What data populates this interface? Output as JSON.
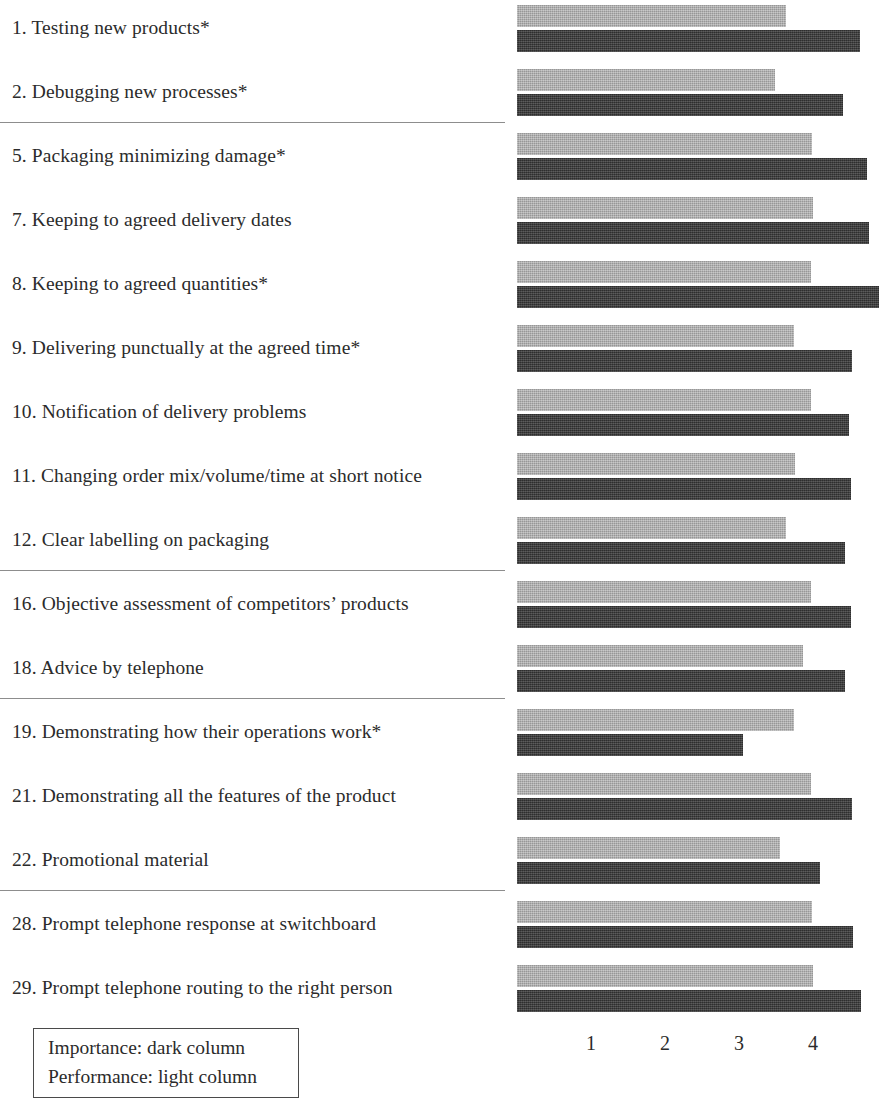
{
  "chart_data": {
    "type": "bar",
    "orientation": "horizontal",
    "title": "",
    "xlabel": "",
    "ylabel": "",
    "xlim": [
      0,
      4.95
    ],
    "xticks": [
      1,
      2,
      3,
      4
    ],
    "grid": false,
    "legend_position": "bottom-left",
    "series": [
      {
        "name": "Importance",
        "style": "dark column",
        "color": "#3b3b3b",
        "values": [
          4.64,
          4.41,
          4.73,
          4.75,
          4.94,
          4.53,
          4.49,
          4.51,
          4.43,
          4.51,
          4.43,
          3.06,
          4.53,
          4.1,
          4.54,
          4.65
        ]
      },
      {
        "name": "Performance",
        "style": "light column",
        "color": "#a9a9a9",
        "values": [
          3.64,
          3.49,
          3.98,
          4.0,
          3.97,
          3.74,
          3.97,
          3.76,
          3.64,
          3.97,
          3.87,
          3.74,
          3.97,
          3.55,
          3.98,
          4.0
        ]
      }
    ],
    "categories": [
      "1. Testing new products*",
      "2. Debugging new processes*",
      "5. Packaging minimizing damage*",
      "7. Keeping to agreed delivery dates",
      "8. Keeping to agreed quantities*",
      "9. Delivering punctually at the agreed time*",
      "10. Notification of delivery problems",
      "11. Changing order mix/volume/time at short notice",
      "12. Clear labelling on packaging",
      "16. Objective assessment of competitors’ products",
      "18. Advice by telephone",
      "19. Demonstrating how their operations work*",
      "21. Demonstrating all the features of the product",
      "22. Promotional material",
      "28. Prompt telephone response at switchboard",
      "29. Prompt telephone routing to the right person"
    ],
    "group_separators_after": [
      1,
      8,
      10,
      13
    ]
  },
  "axis": {
    "ticks": [
      "1",
      "2",
      "3",
      "4"
    ]
  },
  "legend": {
    "line1": "Importance: dark column",
    "line2": "Performance: light column"
  }
}
